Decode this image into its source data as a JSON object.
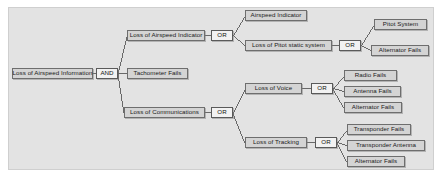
{
  "chart_data": {
    "type": "diagram",
    "diagram_kind": "fault-tree",
    "orientation": "left-to-right",
    "colors": {
      "panel_background": "#e3e3e3",
      "node_fill": "#d4d4d4",
      "node_border": "#6e6e6e",
      "gate_fill": "#f2f2f2",
      "gate_border": "#5a5a5a",
      "edge": "#4a4a4a",
      "page_background": "#ffffff"
    },
    "nodes": [
      {
        "id": "root",
        "label": "Loss of Airspeed Information",
        "kind": "event"
      },
      {
        "id": "and-root",
        "label": "AND",
        "kind": "gate"
      },
      {
        "id": "loss-asi",
        "label": "Loss of Airspeed Indicator",
        "kind": "event"
      },
      {
        "id": "tachometer-fails",
        "label": "Tachometer Fails",
        "kind": "event"
      },
      {
        "id": "loss-comms",
        "label": "Loss of Communications",
        "kind": "event"
      },
      {
        "id": "or-asi",
        "label": "OR",
        "kind": "gate"
      },
      {
        "id": "airspeed-indicator",
        "label": "Airspeed Indicator",
        "kind": "event"
      },
      {
        "id": "loss-pitot",
        "label": "Loss of Pitot static system",
        "kind": "event"
      },
      {
        "id": "or-pitot",
        "label": "OR",
        "kind": "gate"
      },
      {
        "id": "pitot-system",
        "label": "Pitot System",
        "kind": "event"
      },
      {
        "id": "alternator-pitot",
        "label": "Alternator Fails",
        "kind": "event"
      },
      {
        "id": "or-comms",
        "label": "OR",
        "kind": "gate"
      },
      {
        "id": "loss-voice",
        "label": "Loss of Voice",
        "kind": "event"
      },
      {
        "id": "or-voice",
        "label": "OR",
        "kind": "gate"
      },
      {
        "id": "radio-fails",
        "label": "Radio Fails",
        "kind": "event"
      },
      {
        "id": "antenna-fails",
        "label": "Antenna Fails",
        "kind": "event"
      },
      {
        "id": "alternator-voice",
        "label": "Alternator Fails",
        "kind": "event"
      },
      {
        "id": "loss-tracking",
        "label": "Loss of Tracking",
        "kind": "event"
      },
      {
        "id": "or-tracking",
        "label": "OR",
        "kind": "gate"
      },
      {
        "id": "transponder-fails",
        "label": "Transponder Fails",
        "kind": "event"
      },
      {
        "id": "transponder-antenna",
        "label": "Transponder Antenna",
        "kind": "event"
      },
      {
        "id": "alternator-tracking",
        "label": "Alternator Fails",
        "kind": "event"
      }
    ],
    "edges": [
      {
        "from": "root",
        "to": "and-root"
      },
      {
        "from": "and-root",
        "to": "loss-asi"
      },
      {
        "from": "and-root",
        "to": "tachometer-fails"
      },
      {
        "from": "and-root",
        "to": "loss-comms"
      },
      {
        "from": "loss-asi",
        "to": "or-asi"
      },
      {
        "from": "or-asi",
        "to": "airspeed-indicator"
      },
      {
        "from": "or-asi",
        "to": "loss-pitot"
      },
      {
        "from": "loss-pitot",
        "to": "or-pitot"
      },
      {
        "from": "or-pitot",
        "to": "pitot-system"
      },
      {
        "from": "or-pitot",
        "to": "alternator-pitot"
      },
      {
        "from": "loss-comms",
        "to": "or-comms"
      },
      {
        "from": "or-comms",
        "to": "loss-voice"
      },
      {
        "from": "or-comms",
        "to": "loss-tracking"
      },
      {
        "from": "loss-voice",
        "to": "or-voice"
      },
      {
        "from": "or-voice",
        "to": "radio-fails"
      },
      {
        "from": "or-voice",
        "to": "antenna-fails"
      },
      {
        "from": "or-voice",
        "to": "alternator-voice"
      },
      {
        "from": "loss-tracking",
        "to": "or-tracking"
      },
      {
        "from": "or-tracking",
        "to": "transponder-fails"
      },
      {
        "from": "or-tracking",
        "to": "transponder-antenna"
      },
      {
        "from": "or-tracking",
        "to": "alternator-tracking"
      }
    ]
  }
}
